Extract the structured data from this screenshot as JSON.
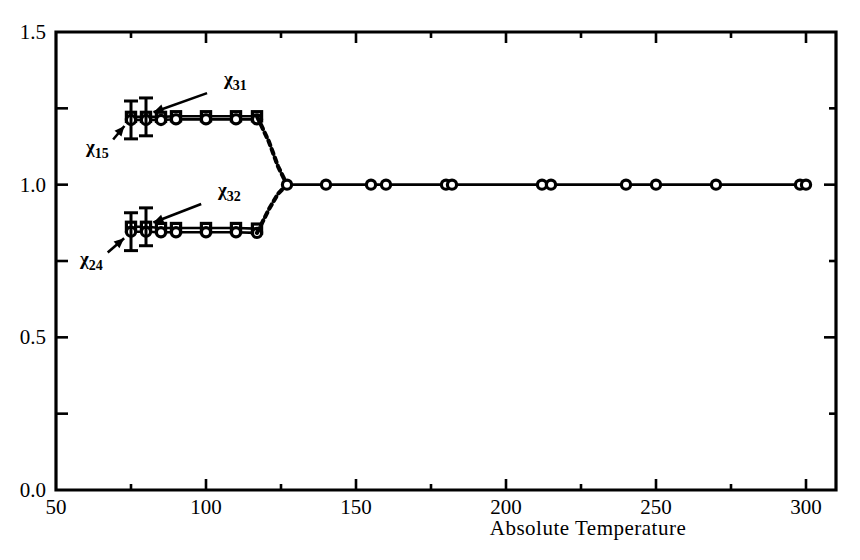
{
  "chart_data": {
    "type": "line",
    "title": "",
    "subtitle": "",
    "xlabel": "Absolute Temperature",
    "ylabel": "",
    "xlim": [
      50,
      310
    ],
    "ylim": [
      0.0,
      1.5
    ],
    "xticks": [
      50,
      100,
      150,
      200,
      250,
      300
    ],
    "xtick_labels": [
      "50",
      "100",
      "150",
      "200",
      "250",
      "300"
    ],
    "xminor_ticks": [
      75,
      125,
      175,
      225,
      275
    ],
    "yticks": [
      0.0,
      0.5,
      1.0,
      1.5
    ],
    "ytick_labels": [
      "0.0",
      "0.5",
      "1.0",
      "1.5"
    ],
    "yminor_ticks": [
      0.25,
      0.75,
      1.25
    ],
    "grid": false,
    "legend_position": "inline-annotations",
    "frame": "box",
    "transition_temperature": 127,
    "series": [
      {
        "name": "x31",
        "label": "χ31",
        "label_base": "χ",
        "label_sub": "31",
        "marker": "square",
        "linestyle": "solid",
        "x": [
          75,
          80,
          85,
          90,
          100,
          110,
          117
        ],
        "y": [
          1.222,
          1.222,
          1.222,
          1.224,
          1.224,
          1.224,
          1.224
        ],
        "annotation_point": [
          80,
          1.228
        ],
        "label_xy": [
          106,
          1.325
        ],
        "errorbars": [
          {
            "x": 80,
            "y": 1.222,
            "err": 0.062
          }
        ]
      },
      {
        "name": "x15",
        "label": "χ15",
        "label_base": "χ",
        "label_sub": "15",
        "marker": "circle",
        "linestyle": "solid",
        "x": [
          75,
          80,
          85,
          90,
          100,
          110,
          117
        ],
        "y": [
          1.212,
          1.212,
          1.212,
          1.214,
          1.214,
          1.214,
          1.214
        ],
        "annotation_point": [
          75,
          1.207
        ],
        "label_xy": [
          60,
          1.105
        ],
        "errorbars": [
          {
            "x": 75,
            "y": 1.212,
            "err": 0.062
          }
        ]
      },
      {
        "name": "x32",
        "label": "χ32",
        "label_base": "χ",
        "label_sub": "32",
        "marker": "square",
        "linestyle": "solid",
        "x": [
          75,
          80,
          85,
          90,
          100,
          110,
          117
        ],
        "y": [
          0.862,
          0.862,
          0.858,
          0.858,
          0.858,
          0.858,
          0.856
        ],
        "annotation_point": [
          80,
          0.866
        ],
        "label_xy": [
          104,
          0.963
        ],
        "errorbars": [
          {
            "x": 80,
            "y": 0.862,
            "err": 0.062
          }
        ]
      },
      {
        "name": "x24",
        "label": "χ24",
        "label_base": "χ",
        "label_sub": "24",
        "marker": "circle",
        "linestyle": "solid",
        "x": [
          75,
          80,
          85,
          90,
          100,
          110,
          117
        ],
        "y": [
          0.846,
          0.846,
          0.844,
          0.844,
          0.844,
          0.844,
          0.842
        ],
        "annotation_point": [
          75,
          0.838
        ],
        "label_xy": [
          58,
          0.738
        ],
        "errorbars": [
          {
            "x": 75,
            "y": 0.846,
            "err": 0.062
          }
        ]
      },
      {
        "name": "upper-transition",
        "label": "",
        "marker": "none",
        "linestyle": "dashed",
        "x": [
          117,
          121,
          124,
          127
        ],
        "y": [
          1.224,
          1.14,
          1.06,
          1.0
        ]
      },
      {
        "name": "lower-transition",
        "label": "",
        "marker": "none",
        "linestyle": "dashed",
        "x": [
          117,
          121,
          124,
          127
        ],
        "y": [
          0.842,
          0.92,
          0.97,
          1.0
        ]
      },
      {
        "name": "cubic-phase",
        "label": "",
        "marker": "circle",
        "linestyle": "solid",
        "x": [
          127,
          140,
          155,
          160,
          180,
          182,
          212,
          215,
          240,
          250,
          270,
          298,
          300
        ],
        "y": [
          1.0,
          1.0,
          1.0,
          1.0,
          1.0,
          1.0,
          1.0,
          1.0,
          1.0,
          1.0,
          1.0,
          1.0,
          1.0
        ]
      }
    ]
  },
  "colors": {
    "ink": "#000000",
    "background": "#ffffff"
  }
}
